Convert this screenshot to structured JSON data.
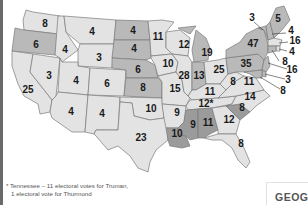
{
  "map": {
    "title": "1948 Presidential Election Electoral Votes",
    "colors": {
      "light": "#e3e3e3",
      "medium": "#b9b9b9",
      "dark": "#9b9b9b",
      "border": "#7a7a7a"
    },
    "states": [
      {
        "id": "WA",
        "votes": "8",
        "shade": "light"
      },
      {
        "id": "OR",
        "votes": "6",
        "shade": "medium"
      },
      {
        "id": "CA",
        "votes": "25",
        "shade": "light"
      },
      {
        "id": "NV",
        "votes": "3",
        "shade": "light"
      },
      {
        "id": "ID",
        "votes": "4",
        "shade": "light"
      },
      {
        "id": "MT",
        "votes": "4",
        "shade": "light"
      },
      {
        "id": "WY",
        "votes": "3",
        "shade": "light"
      },
      {
        "id": "UT",
        "votes": "4",
        "shade": "light"
      },
      {
        "id": "CO",
        "votes": "6",
        "shade": "light"
      },
      {
        "id": "AZ",
        "votes": "4",
        "shade": "light"
      },
      {
        "id": "NM",
        "votes": "4",
        "shade": "light"
      },
      {
        "id": "ND",
        "votes": "4",
        "shade": "medium"
      },
      {
        "id": "SD",
        "votes": "4",
        "shade": "medium"
      },
      {
        "id": "NE",
        "votes": "6",
        "shade": "medium"
      },
      {
        "id": "KS",
        "votes": "8",
        "shade": "medium"
      },
      {
        "id": "OK",
        "votes": "10",
        "shade": "light"
      },
      {
        "id": "TX",
        "votes": "23",
        "shade": "light"
      },
      {
        "id": "MN",
        "votes": "11",
        "shade": "light"
      },
      {
        "id": "IA",
        "votes": "10",
        "shade": "light"
      },
      {
        "id": "MO",
        "votes": "15",
        "shade": "light"
      },
      {
        "id": "AR",
        "votes": "9",
        "shade": "light"
      },
      {
        "id": "LA",
        "votes": "10",
        "shade": "dark"
      },
      {
        "id": "WI",
        "votes": "12",
        "shade": "light"
      },
      {
        "id": "IL",
        "votes": "28",
        "shade": "light"
      },
      {
        "id": "MI",
        "votes": "19",
        "shade": "medium"
      },
      {
        "id": "IN",
        "votes": "13",
        "shade": "medium"
      },
      {
        "id": "OH",
        "votes": "25",
        "shade": "light"
      },
      {
        "id": "KY",
        "votes": "11",
        "shade": "light"
      },
      {
        "id": "TN",
        "votes": "12*",
        "shade": "light"
      },
      {
        "id": "MS",
        "votes": "9",
        "shade": "dark"
      },
      {
        "id": "AL",
        "votes": "11",
        "shade": "dark"
      },
      {
        "id": "GA",
        "votes": "12",
        "shade": "light"
      },
      {
        "id": "FL",
        "votes": "8",
        "shade": "light"
      },
      {
        "id": "SC",
        "votes": "8",
        "shade": "dark"
      },
      {
        "id": "NC",
        "votes": "14",
        "shade": "light"
      },
      {
        "id": "VA",
        "votes": "11",
        "shade": "light"
      },
      {
        "id": "WV",
        "votes": "8",
        "shade": "light"
      },
      {
        "id": "PA",
        "votes": "35",
        "shade": "medium"
      },
      {
        "id": "NY",
        "votes": "47",
        "shade": "medium"
      },
      {
        "id": "VT",
        "votes": "3",
        "shade": "medium"
      },
      {
        "id": "ME",
        "votes": "5",
        "shade": "medium"
      },
      {
        "id": "NH",
        "votes": "4",
        "shade": "medium"
      },
      {
        "id": "MA",
        "votes": "16",
        "shade": "light"
      },
      {
        "id": "RI",
        "votes": "4",
        "shade": "light"
      },
      {
        "id": "CT",
        "votes": "8",
        "shade": "medium"
      },
      {
        "id": "NJ",
        "votes": "16",
        "shade": "medium"
      },
      {
        "id": "DE",
        "votes": "3",
        "shade": "medium"
      },
      {
        "id": "MD",
        "votes": "8",
        "shade": "medium"
      }
    ]
  },
  "footnote": {
    "line1": "* Tennessee – 11 electoral votes for Truman,",
    "line2": "1 electoral vote for Thurmond"
  },
  "corner_label": "GEOGR"
}
